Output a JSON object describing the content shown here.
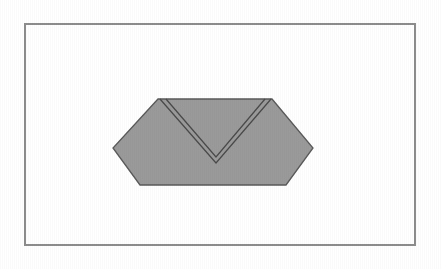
{
  "figure": {
    "caption": "",
    "background_color": "#ffffff",
    "frame": {
      "name": "figure-border",
      "x": 25,
      "y": 24,
      "width": 390,
      "height": 221,
      "stroke_color": "#8d8d8d",
      "stroke_width": 1.4,
      "fill_color": "#ffffff"
    },
    "shape": {
      "name": "folded-hexagon",
      "label": "",
      "fill_color": "#9a9a9a",
      "stroke_color": "#5a5a5a",
      "stroke_width": 1.3,
      "vertices": [
        {
          "id": "top-left",
          "x": 158,
          "y": 99
        },
        {
          "id": "top-right",
          "x": 272,
          "y": 99
        },
        {
          "id": "right",
          "x": 313,
          "y": 148
        },
        {
          "id": "bottom-right",
          "x": 286,
          "y": 185
        },
        {
          "id": "bottom-left",
          "x": 140,
          "y": 185
        },
        {
          "id": "left",
          "x": 113,
          "y": 148
        }
      ]
    },
    "crease": {
      "name": "v-fold-crease",
      "stroke_color": "#4a4a4a",
      "stroke_width": 1.25,
      "line_gap": 4,
      "apex": {
        "x": 216,
        "y": 163
      },
      "outer_left": {
        "x": 160,
        "y": 99
      },
      "outer_right": {
        "x": 271,
        "y": 99
      },
      "inner_left": {
        "x": 166,
        "y": 99
      },
      "inner_right": {
        "x": 265,
        "y": 99
      },
      "inner_apex": {
        "x": 216,
        "y": 157
      }
    }
  }
}
